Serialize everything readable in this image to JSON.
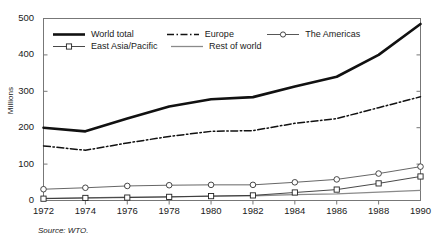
{
  "chart_data": {
    "type": "line",
    "title": "",
    "xlabel": "",
    "ylabel": "Millions",
    "xlim": [
      1972,
      1990
    ],
    "ylim": [
      0,
      500
    ],
    "yticks": [
      0,
      100,
      200,
      300,
      400,
      500
    ],
    "grid": false,
    "legend_position": "top-left-inside",
    "x": [
      1972,
      1974,
      1976,
      1978,
      1980,
      1982,
      1984,
      1986,
      1988,
      1990
    ],
    "categories": [
      "1972",
      "1974",
      "1976",
      "1978",
      "1980",
      "1982",
      "1984",
      "1986",
      "1988",
      "1990"
    ],
    "series": [
      {
        "name": "World total",
        "values": [
          200,
          190,
          225,
          258,
          278,
          284,
          313,
          340,
          400,
          485
        ],
        "style": "solid",
        "width": 2.6,
        "color": "#111111",
        "marker": "none"
      },
      {
        "name": "Europe",
        "values": [
          150,
          138,
          158,
          176,
          190,
          192,
          212,
          225,
          255,
          285
        ],
        "style": "dashdot",
        "width": 1.5,
        "color": "#111111",
        "marker": "none"
      },
      {
        "name": "The Americas",
        "values": [
          31,
          35,
          40,
          42,
          43,
          43,
          50,
          58,
          74,
          93
        ],
        "style": "solid",
        "width": 0.9,
        "color": "#555555",
        "marker": "circle"
      },
      {
        "name": "East Asia/Pacific",
        "values": [
          5,
          7,
          8,
          10,
          12,
          14,
          22,
          30,
          47,
          66
        ],
        "style": "solid",
        "width": 0.9,
        "color": "#333333",
        "marker": "square"
      },
      {
        "name": "Rest of world",
        "values": [
          6,
          7,
          9,
          10,
          12,
          13,
          16,
          18,
          23,
          28
        ],
        "style": "solid",
        "width": 1.3,
        "color": "#8a8a8a",
        "marker": "none"
      }
    ],
    "source_note": "Source: WTO."
  },
  "legend": {
    "items": [
      {
        "label": "World total",
        "key": "thick-solid-line"
      },
      {
        "label": "Europe",
        "key": "dash-dot-line"
      },
      {
        "label": "The Americas",
        "key": "circle-marker-line"
      },
      {
        "label": "East Asia/Pacific",
        "key": "square-marker-line"
      },
      {
        "label": "Rest of world",
        "key": "thin-gray-line"
      }
    ]
  },
  "axes": {
    "y_title": "Millions",
    "y_tick_labels": [
      "500",
      "400",
      "300",
      "200",
      "100",
      "0"
    ],
    "x_tick_labels": [
      "1972",
      "1974",
      "1976",
      "1978",
      "1980",
      "1982",
      "1984",
      "1986",
      "1988",
      "1990"
    ]
  },
  "footer": {
    "source": "Source: WTO."
  },
  "colors": {
    "axis": "#777777",
    "world_total": "#111111",
    "europe": "#111111",
    "americas": "#555555",
    "east_asia_pacific": "#333333",
    "rest_of_world": "#8a8a8a"
  },
  "topcrop": {
    "ghost_text": ""
  }
}
